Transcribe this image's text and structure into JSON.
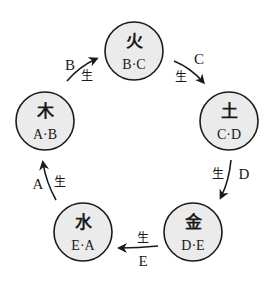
{
  "diagram": {
    "type": "cycle",
    "nodes": [
      {
        "id": "fire",
        "char": "火",
        "sub": "B·C",
        "cx": 134,
        "cy": 51,
        "r": 29
      },
      {
        "id": "earth",
        "char": "土",
        "sub": "C·D",
        "cx": 229,
        "cy": 121,
        "r": 29
      },
      {
        "id": "metal",
        "char": "金",
        "sub": "D·E",
        "cx": 193,
        "cy": 232,
        "r": 29
      },
      {
        "id": "water",
        "char": "水",
        "sub": "E·A",
        "cx": 83,
        "cy": 232,
        "r": 29
      },
      {
        "id": "wood",
        "char": "木",
        "sub": "A·B",
        "cx": 45,
        "cy": 121,
        "r": 29
      }
    ],
    "edges": [
      {
        "from": "wood",
        "to": "fire",
        "letter": "B",
        "relation": "生"
      },
      {
        "from": "fire",
        "to": "earth",
        "letter": "C",
        "relation": "生"
      },
      {
        "from": "earth",
        "to": "metal",
        "letter": "D",
        "relation": "生"
      },
      {
        "from": "metal",
        "to": "water",
        "letter": "E",
        "relation": "生"
      },
      {
        "from": "water",
        "to": "wood",
        "letter": "A",
        "relation": "生"
      }
    ]
  }
}
